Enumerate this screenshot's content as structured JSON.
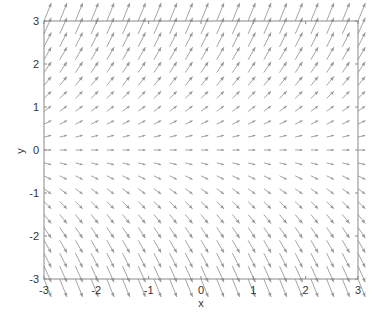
{
  "chart_data": {
    "type": "quiver",
    "title": "",
    "xlabel": "x",
    "ylabel": "y",
    "xlim": [
      -3,
      3
    ],
    "ylim": [
      -3,
      3
    ],
    "xticks": [
      -3,
      -2,
      -1,
      0,
      1,
      2,
      3
    ],
    "yticks": [
      -3,
      -2,
      -1,
      0,
      1,
      2,
      3
    ],
    "xtick_labels": [
      "-3",
      "-2",
      "-1",
      "0",
      "1",
      "2",
      "3"
    ],
    "ytick_labels": [
      "-3",
      "-2",
      "-1",
      "0",
      "1",
      "2",
      "3"
    ],
    "grid": false,
    "legend": null,
    "field": {
      "u": "1",
      "v": "y",
      "description": "Direction field dx=1, dy=y; arrows point up-right for y>0, horizontal at y=0, down-right for y<0",
      "x_grid": {
        "start": -3,
        "stop": 3,
        "step": 0.3
      },
      "y_grid": {
        "start": -3,
        "stop": 3,
        "step": 0.3
      }
    },
    "colors": {
      "arrow": "#9a9a9a",
      "axes": "#8a8a8a",
      "text": "#333333",
      "background": "#ffffff"
    }
  }
}
